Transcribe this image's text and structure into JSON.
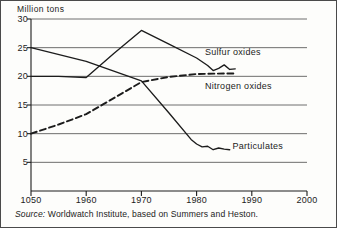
{
  "figure": {
    "unit_label": "Million tons",
    "source_prefix": "Source:",
    "source_text": "Worldwatch Institute, based on Summers and Heston."
  },
  "chart_data": {
    "type": "line",
    "title": "",
    "xlabel": "",
    "ylabel": "Million tons",
    "xlim": [
      1950,
      2000
    ],
    "ylim": [
      0,
      30
    ],
    "yticks": [
      5,
      10,
      15,
      20,
      25,
      30
    ],
    "ytick_labels": [
      "5",
      "10",
      "15",
      "20",
      "25",
      "30"
    ],
    "xticks": [
      1950,
      1960,
      1970,
      1980,
      1990,
      2000
    ],
    "xtick_labels": [
      "1050",
      "1960",
      "1970",
      "1980",
      "1990",
      "2000"
    ],
    "grid": "horizontal",
    "legend": "inline-annotations",
    "series": [
      {
        "name": "Sulfur oxides",
        "style": "solid",
        "color": "#1c1c1c",
        "label_x": 1981.5,
        "label_y": 24.1,
        "points": [
          [
            1950,
            20.0
          ],
          [
            1955,
            20.0
          ],
          [
            1960,
            19.8
          ],
          [
            1965,
            24.0
          ],
          [
            1970,
            28.0
          ],
          [
            1975,
            25.6
          ],
          [
            1980,
            23.2
          ],
          [
            1982,
            21.9
          ],
          [
            1983,
            21.0
          ],
          [
            1984,
            21.4
          ],
          [
            1985,
            22.0
          ],
          [
            1986,
            21.2
          ],
          [
            1987,
            21.3
          ]
        ]
      },
      {
        "name": "Nitrogen oxides",
        "style": "dashed",
        "color": "#1c1c1c",
        "label_x": 1981.5,
        "label_y": 18.2,
        "points": [
          [
            1950,
            10.0
          ],
          [
            1955,
            11.6
          ],
          [
            1960,
            13.4
          ],
          [
            1965,
            16.2
          ],
          [
            1970,
            19.0
          ],
          [
            1975,
            19.9
          ],
          [
            1980,
            20.4
          ],
          [
            1985,
            20.5
          ],
          [
            1987,
            20.5
          ]
        ]
      },
      {
        "name": "Particulates",
        "style": "solid",
        "color": "#1c1c1c",
        "label_x": 1986.5,
        "label_y": 7.6,
        "points": [
          [
            1950,
            25.0
          ],
          [
            1960,
            22.6
          ],
          [
            1970,
            19.2
          ],
          [
            1975,
            13.6
          ],
          [
            1979,
            9.0
          ],
          [
            1980,
            8.2
          ],
          [
            1981,
            7.7
          ],
          [
            1982,
            7.8
          ],
          [
            1983,
            7.2
          ],
          [
            1984,
            7.5
          ],
          [
            1985,
            7.3
          ],
          [
            1986,
            7.2
          ]
        ]
      }
    ]
  }
}
